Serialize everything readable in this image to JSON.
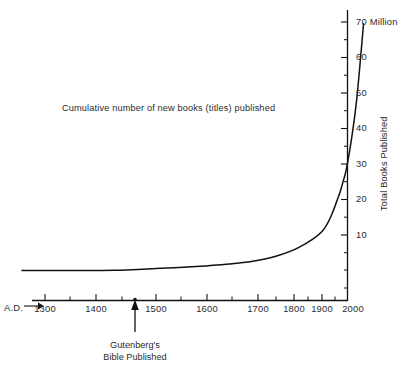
{
  "chart_data": {
    "type": "line",
    "title": "Cumulative number of new books (titles) published",
    "xlabel": "A.D.",
    "ylabel": "Total Books Published",
    "y_unit_label": "70 Million",
    "xlim": [
      1250,
      2000
    ],
    "ylim": [
      0,
      72
    ],
    "grid": false,
    "legend": null,
    "x_tick_labels": [
      "1300",
      "1400",
      "1500",
      "1600",
      "1700",
      "1800",
      "1900",
      "2000"
    ],
    "x_ticks": [
      1300,
      1400,
      1500,
      1600,
      1700,
      1800,
      1900,
      2000
    ],
    "x_minor_ticks": [
      1350,
      1450,
      1550,
      1650,
      1750,
      1850,
      1950
    ],
    "y_tick_labels": [
      "10",
      "20",
      "30",
      "40",
      "50",
      "60",
      "70 Million"
    ],
    "y_ticks": [
      10,
      20,
      30,
      40,
      50,
      60,
      70
    ],
    "y_minor_ticks": [
      5,
      15,
      25,
      35,
      45,
      55,
      65
    ],
    "series": [
      {
        "name": "Cumulative titles published",
        "x": [
          1250,
          1300,
          1350,
          1400,
          1450,
          1500,
          1550,
          1600,
          1650,
          1700,
          1750,
          1800,
          1850,
          1900,
          1925,
          1950,
          1965,
          1975,
          1985,
          1990
        ],
        "values": [
          0,
          0,
          0,
          0,
          0.05,
          0.3,
          0.6,
          0.9,
          1.3,
          1.8,
          2.6,
          4.0,
          6.5,
          11.0,
          17.0,
          27.0,
          38.0,
          48.0,
          62.0,
          69.5
        ]
      }
    ],
    "annotations": [
      {
        "name": "gutenberg-marker",
        "x": 1450,
        "y": 0,
        "line1": "Gutenberg's",
        "line2": "Bible Published"
      }
    ],
    "colors": {
      "line": "#111111",
      "axis": "#111111",
      "text": "#2b2b2b",
      "background": "#ffffff"
    }
  },
  "axis": {
    "ad_label": "A.D."
  }
}
